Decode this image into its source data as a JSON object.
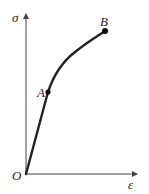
{
  "diagram": {
    "y_axis_label": "σ",
    "x_axis_label": "ε",
    "origin_label": "O",
    "points": [
      {
        "label": "A",
        "description": "end of linear region"
      },
      {
        "label": "B",
        "description": "end point of curve"
      }
    ],
    "colors": {
      "curve": "#222222",
      "axis": "#444444",
      "background": "#ffffff"
    }
  }
}
